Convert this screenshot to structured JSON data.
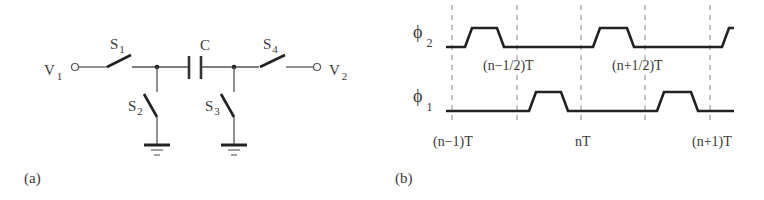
{
  "figure": {
    "panel_a": {
      "caption": "(a)",
      "input_label": "V",
      "input_sub": "1",
      "output_label": "V",
      "output_sub": "2",
      "capacitor_label": "C",
      "switches": [
        {
          "name": "S",
          "sub": "1"
        },
        {
          "name": "S",
          "sub": "2"
        },
        {
          "name": "S",
          "sub": "3"
        },
        {
          "name": "S",
          "sub": "4"
        }
      ]
    },
    "panel_b": {
      "caption": "(b)",
      "phase2_label": "ϕ",
      "phase2_sub": "2",
      "phase1_label": "ϕ",
      "phase1_sub": "1",
      "time_labels_mid": [
        "(n−1/2)T",
        "(n+1/2)T"
      ],
      "time_labels_bottom": [
        "(n−1)T",
        "nT",
        "(n+1)T"
      ]
    }
  }
}
